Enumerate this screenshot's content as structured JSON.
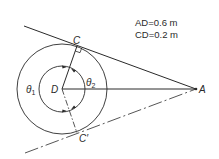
{
  "diagram": {
    "given": {
      "line1": "AD=0.6 m",
      "line2": "CD=0.2 m"
    },
    "points": {
      "C": "C",
      "C_prime": "C′",
      "D": "D",
      "A": "A"
    },
    "angles": {
      "theta1": "θ",
      "theta1_sub": "1",
      "theta2": "θ",
      "theta2_sub": "2"
    },
    "geometry": {
      "D": [
        62,
        89
      ],
      "A": [
        196,
        89
      ],
      "C": [
        77,
        46
      ],
      "C_prime": [
        77,
        133
      ],
      "outer_radius": 45,
      "inner_radius": 23
    },
    "colors": {
      "line": "#2a2a2a",
      "background": "#ffffff"
    }
  }
}
